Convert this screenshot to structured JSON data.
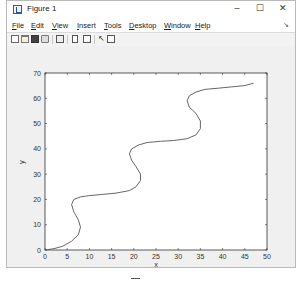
{
  "window": {
    "title": "Figure 1",
    "controls": {
      "minimize": "–",
      "maximize": "☐",
      "close": "✕"
    }
  },
  "menubar": {
    "items": [
      {
        "label": "File",
        "mnemonic": "F"
      },
      {
        "label": "Edit",
        "mnemonic": "E"
      },
      {
        "label": "View",
        "mnemonic": "V"
      },
      {
        "label": "Insert",
        "mnemonic": "I"
      },
      {
        "label": "Tools",
        "mnemonic": "T"
      },
      {
        "label": "Desktop",
        "mnemonic": "D"
      },
      {
        "label": "Window",
        "mnemonic": "W"
      },
      {
        "label": "Help",
        "mnemonic": "H"
      }
    ],
    "overflow_arrow": "↘"
  },
  "toolbar": {
    "icons": [
      "new-figure-icon",
      "open-file-icon",
      "save-icon",
      "print-icon",
      "link-plot-icon",
      "colorbar-icon",
      "legend-icon",
      "pointer-icon",
      "property-inspector-icon"
    ]
  },
  "chart_data": {
    "type": "line",
    "title": "",
    "xlabel": "x",
    "ylabel": "y",
    "xlim": [
      0,
      50
    ],
    "ylim": [
      0,
      70
    ],
    "xticks": [
      0,
      5,
      10,
      15,
      20,
      25,
      30,
      35,
      40,
      45,
      50
    ],
    "yticks": [
      0,
      10,
      20,
      30,
      40,
      50,
      60,
      70
    ],
    "grid": false,
    "legend": null,
    "series": [
      {
        "name": "curve",
        "color": "#555555",
        "x": [
          0,
          2,
          4,
          6,
          7.5,
          8,
          7.5,
          6.5,
          6,
          6.5,
          8,
          10,
          13,
          16,
          19,
          20.5,
          21.5,
          21.5,
          20.5,
          19.5,
          19,
          19.5,
          21,
          23,
          26,
          29,
          32,
          34,
          35,
          35,
          34,
          32.5,
          32,
          32.5,
          34,
          36,
          39,
          42,
          45,
          47
        ],
        "y": [
          0,
          0.5,
          1.5,
          3.5,
          6,
          9,
          12,
          15,
          18,
          20,
          21,
          21.5,
          22,
          22.5,
          23.5,
          25,
          27.5,
          30,
          33,
          35.5,
          38,
          40,
          41.5,
          42.5,
          43,
          43.3,
          44,
          45.5,
          48,
          51,
          54,
          56.5,
          59,
          61,
          62.5,
          63.5,
          64,
          64.5,
          65,
          66
        ]
      }
    ]
  }
}
